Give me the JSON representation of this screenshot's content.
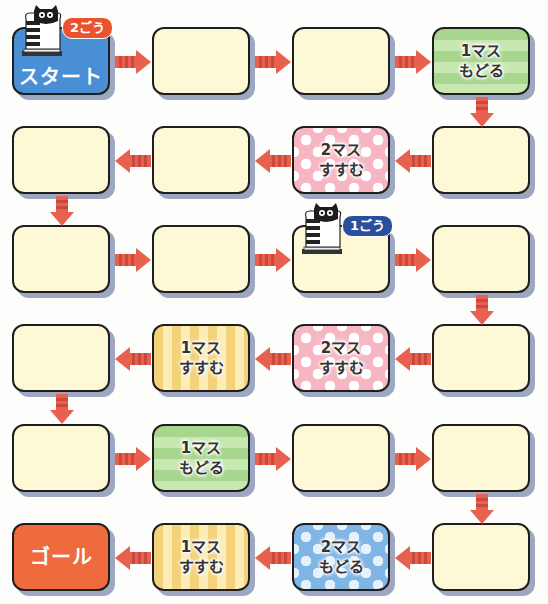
{
  "colors": {
    "start": "#4a8fd6",
    "goal": "#ef6a3c",
    "blank": "#fdf9d6",
    "arrow": "#e8614f",
    "arrow_stripe": "#c94a3c",
    "shadow": "#9ea7c2",
    "player2_badge": "#e9532f",
    "player1_badge": "#28509b"
  },
  "board": {
    "cells": [
      {
        "id": "start",
        "row": 0,
        "col": 0,
        "type": "start",
        "label": "スタート"
      },
      {
        "id": "c2",
        "row": 0,
        "col": 1,
        "type": "blank",
        "label": ""
      },
      {
        "id": "c3",
        "row": 0,
        "col": 2,
        "type": "blank",
        "label": ""
      },
      {
        "id": "c4",
        "row": 0,
        "col": 3,
        "type": "green",
        "label": "1マス\nもどる"
      },
      {
        "id": "c5",
        "row": 1,
        "col": 3,
        "type": "blank",
        "label": ""
      },
      {
        "id": "c6",
        "row": 1,
        "col": 2,
        "type": "pink",
        "label": "2マス\nすすむ"
      },
      {
        "id": "c7",
        "row": 1,
        "col": 1,
        "type": "blank",
        "label": ""
      },
      {
        "id": "c8",
        "row": 1,
        "col": 0,
        "type": "blank",
        "label": ""
      },
      {
        "id": "c9",
        "row": 2,
        "col": 0,
        "type": "blank",
        "label": ""
      },
      {
        "id": "c10",
        "row": 2,
        "col": 1,
        "type": "blank",
        "label": ""
      },
      {
        "id": "c11",
        "row": 2,
        "col": 2,
        "type": "blank",
        "label": ""
      },
      {
        "id": "c12",
        "row": 2,
        "col": 3,
        "type": "blank",
        "label": ""
      },
      {
        "id": "c13",
        "row": 3,
        "col": 3,
        "type": "blank",
        "label": ""
      },
      {
        "id": "c14",
        "row": 3,
        "col": 2,
        "type": "pink",
        "label": "2マス\nすすむ"
      },
      {
        "id": "c15",
        "row": 3,
        "col": 1,
        "type": "yellow",
        "label": "1マス\nすすむ"
      },
      {
        "id": "c16",
        "row": 3,
        "col": 0,
        "type": "blank",
        "label": ""
      },
      {
        "id": "c17",
        "row": 4,
        "col": 0,
        "type": "blank",
        "label": ""
      },
      {
        "id": "c18",
        "row": 4,
        "col": 1,
        "type": "green",
        "label": "1マス\nもどる"
      },
      {
        "id": "c19",
        "row": 4,
        "col": 2,
        "type": "blank",
        "label": ""
      },
      {
        "id": "c20",
        "row": 4,
        "col": 3,
        "type": "blank",
        "label": ""
      },
      {
        "id": "c21",
        "row": 5,
        "col": 3,
        "type": "blank",
        "label": ""
      },
      {
        "id": "c22",
        "row": 5,
        "col": 2,
        "type": "blue",
        "label": "2マス\nもどる"
      },
      {
        "id": "c23",
        "row": 5,
        "col": 1,
        "type": "yellow",
        "label": "1マス\nすすむ"
      },
      {
        "id": "goal",
        "row": 5,
        "col": 0,
        "type": "goal",
        "label": "ゴール"
      }
    ]
  },
  "pieces": [
    {
      "id": "player-2",
      "label": "2ごう",
      "cell": "start",
      "badge_color": "red"
    },
    {
      "id": "player-1",
      "label": "1ごう",
      "cell": "c11",
      "badge_color": "navy"
    }
  ]
}
